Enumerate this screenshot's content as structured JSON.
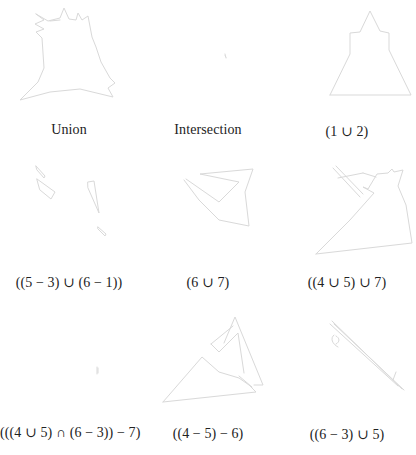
{
  "figure": {
    "stroke_color": "#d9d9d9",
    "text_color": "#222222",
    "background": "#ffffff",
    "panels": [
      {
        "id": "union",
        "caption": "Union"
      },
      {
        "id": "intersection",
        "caption": "Intersection"
      },
      {
        "id": "1-union-2",
        "caption": "(1 ∪ 2)"
      },
      {
        "id": "5m3-union-6m1",
        "caption": "((5 − 3) ∪ (6 − 1))"
      },
      {
        "id": "6-union-7",
        "caption": "(6 ∪ 7)"
      },
      {
        "id": "4u5-union-7",
        "caption": "((4 ∪ 5) ∪ 7)"
      },
      {
        "id": "4u5-int-6m3-minus-7",
        "caption": "(((4 ∪ 5) ∩ (6 − 3)) − 7)"
      },
      {
        "id": "4m5-minus-6",
        "caption": "((4 − 5) − 6)"
      },
      {
        "id": "6m3-union-5",
        "caption": "((6 − 3) ∪ 5)"
      }
    ]
  }
}
